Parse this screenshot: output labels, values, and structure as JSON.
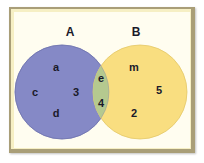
{
  "diagram": {
    "type": "venn",
    "sets": [
      {
        "label": "A",
        "color": "#8589c6",
        "elements": [
          "a",
          "c",
          "3",
          "d"
        ]
      },
      {
        "label": "B",
        "color": "#f9de80",
        "elements": [
          "m",
          "5",
          "2"
        ]
      }
    ],
    "intersection": {
      "color": "#b5c98f",
      "elements": [
        "e",
        "4"
      ]
    },
    "frame": {
      "background": "#fffdf0",
      "border": "#a99e78",
      "highlight": "#f6efc4"
    },
    "labels": {
      "set_a": "A",
      "set_b": "B",
      "a_only": [
        "a",
        "c",
        "3",
        "d"
      ],
      "both": [
        "e",
        "4"
      ],
      "b_only": [
        "m",
        "5",
        "2"
      ]
    }
  }
}
